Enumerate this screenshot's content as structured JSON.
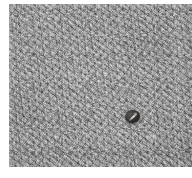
{
  "figure": {
    "kind": "photograph",
    "medium": "grayscale-photograph",
    "subject_description": "small dark elliptical object on a coarse grainy gray surface",
    "surface_description": "uniform coarse-grained mottled gray texture filling the frame",
    "orientation": "landscape",
    "plate": {
      "left_px": 9,
      "top_px": 4,
      "width_px": 183,
      "height_px": 163
    },
    "margin": {
      "background_color": "#ffffff",
      "left_px": 9,
      "top_px": 4,
      "bottom_px": 11
    },
    "colors": {
      "surface_light": "#a9a9a9",
      "surface_mid": "#9a9a9a",
      "surface_dark": "#8a8a8a",
      "subject_core": "#1b1a19",
      "subject_rim": "#3a3836",
      "subject_highlight": "#e2e0db",
      "page_background": "#ffffff",
      "credit_text": "#b6b6b6"
    },
    "subject": {
      "label": "dark elliptical object",
      "center_x_px": 123,
      "center_y_px": 112,
      "width_px": 15,
      "height_px": 13,
      "rotation_deg": -8,
      "highlight": "light diagonal streak across the body"
    },
    "specks": [
      {
        "label": "pale speck",
        "x_px": 141,
        "y_px": 130
      },
      {
        "label": "pale speck",
        "x_px": 62,
        "y_px": 98
      }
    ],
    "credit": {
      "text": "",
      "visible": true,
      "note": "illegible faint vertical text in lower-left margin"
    }
  }
}
